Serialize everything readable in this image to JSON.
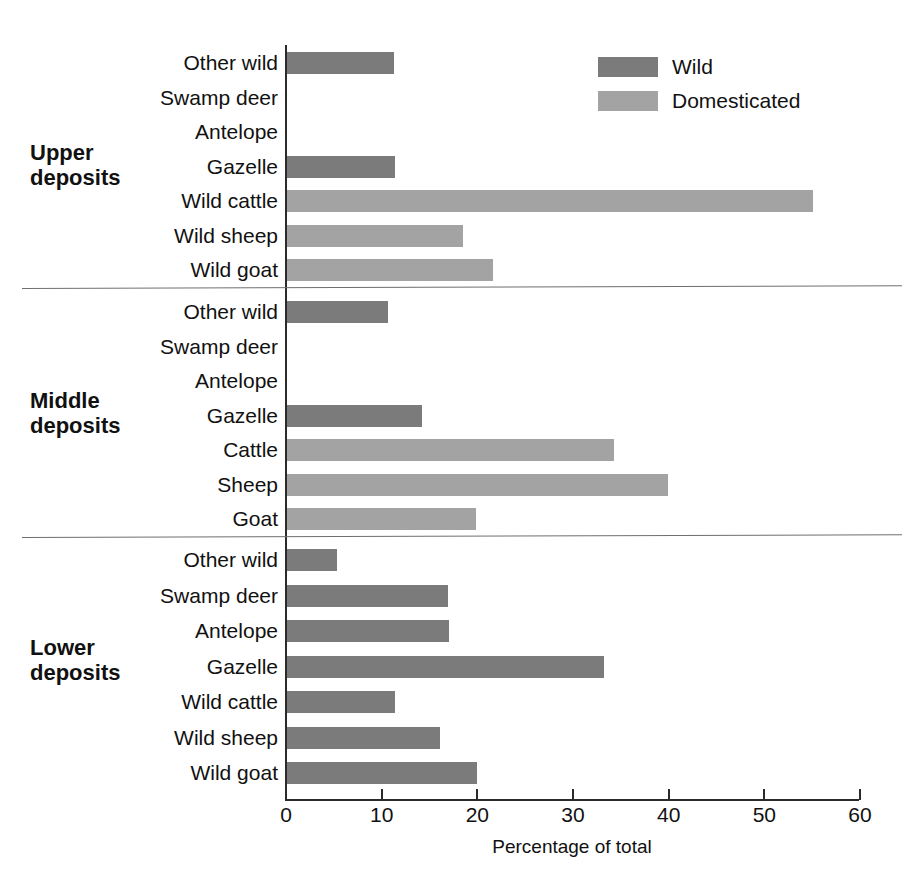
{
  "chart_data": {
    "type": "bar",
    "orientation": "horizontal",
    "title": "",
    "xlabel": "Percentage of total",
    "ylabel": "",
    "xlim": [
      0,
      60
    ],
    "xticks": [
      0,
      10,
      20,
      30,
      40,
      50,
      60
    ],
    "xtick_labels": [
      "0",
      "10",
      "20",
      "30",
      "40",
      "50",
      "60"
    ],
    "grid": false,
    "legend": {
      "position": "top-right",
      "entries": [
        {
          "name": "Wild",
          "color": "#7b7b7b"
        },
        {
          "name": "Domesticated",
          "color": "#a3a3a3"
        }
      ]
    },
    "groups": [
      {
        "name": "Upper\ndeposits",
        "categories": [
          "Other wild",
          "Swamp deer",
          "Antelope",
          "Gazelle",
          "Wild cattle",
          "Wild sheep",
          "Wild goat"
        ],
        "values": [
          11.2,
          0,
          0,
          11.3,
          55.0,
          18.4,
          21.5
        ],
        "series": [
          "Wild",
          "Wild",
          "Wild",
          "Wild",
          "Domesticated",
          "Domesticated",
          "Domesticated"
        ]
      },
      {
        "name": "Middle\ndeposits",
        "categories": [
          "Other wild",
          "Swamp deer",
          "Antelope",
          "Gazelle",
          "Cattle",
          "Sheep",
          "Goat"
        ],
        "values": [
          10.6,
          0,
          0,
          14.1,
          34.2,
          39.8,
          19.8
        ],
        "series": [
          "Wild",
          "Wild",
          "Wild",
          "Wild",
          "Domesticated",
          "Domesticated",
          "Domesticated"
        ]
      },
      {
        "name": "Lower\ndeposits",
        "categories": [
          "Other wild",
          "Swamp deer",
          "Antelope",
          "Gazelle",
          "Wild cattle",
          "Wild sheep",
          "Wild goat"
        ],
        "values": [
          5.2,
          16.8,
          16.9,
          33.1,
          11.3,
          16.0,
          19.9
        ],
        "series": [
          "Wild",
          "Wild",
          "Wild",
          "Wild",
          "Wild",
          "Wild",
          "Wild"
        ]
      }
    ]
  },
  "axis": {
    "x_title": "Percentage of total"
  },
  "colors": {
    "wild": "#7b7b7b",
    "domesticated": "#a3a3a3",
    "axis": "#2b2b2b",
    "divider": "#6f6f6f",
    "background": "#ffffff"
  }
}
